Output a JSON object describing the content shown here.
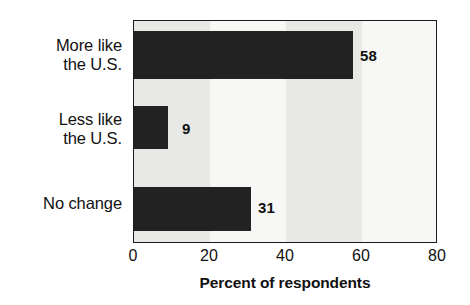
{
  "chart_data": {
    "type": "bar",
    "orientation": "horizontal",
    "title": "",
    "xlabel": "Percent of respondents",
    "ylabel": "",
    "categories": [
      "More like\nthe U.S.",
      "Less like\nthe U.S.",
      "No change"
    ],
    "values": [
      58,
      9,
      31
    ],
    "value_labels": [
      "58",
      "9",
      "31"
    ],
    "xlim": [
      0,
      80
    ],
    "xticks": [
      0,
      20,
      40,
      60,
      80
    ],
    "xtick_labels": [
      "0",
      "20",
      "40",
      "60",
      "80"
    ],
    "grid": false,
    "legend": null,
    "bar_color": "#222222",
    "plot_background": "#f2f2f0",
    "band_colors": [
      "#e8e8e6",
      "#f7f7f5"
    ],
    "axis_color": "#1a1a1a"
  }
}
